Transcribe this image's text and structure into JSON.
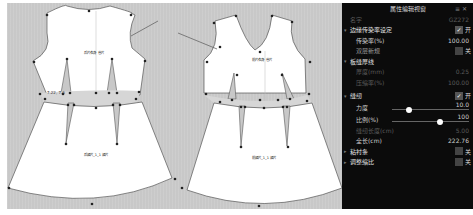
{
  "canvas": {
    "pieces": [
      {
        "name": "前片衣身",
        "label": "后片衣身 省片",
        "skirt_label": "后裙片_1_1 裙片"
      },
      {
        "name": "前片衣身V领",
        "label": "前片衣身 省片",
        "skirt_label": "前裙片_1_1 裙片"
      }
    ],
    "waist_measure": "7.22, 7.6",
    "colors": {
      "background": "#c8c8c8",
      "piece_fill": "#ffffff",
      "outline": "#555555",
      "waistband": "#d6d6d6"
    }
  },
  "panel": {
    "title": "属性编辑视窗",
    "header_icons": [
      "pin-icon",
      "close-icon"
    ],
    "rows": [
      {
        "type": "field",
        "label": "名字",
        "value": "GZ272",
        "dim": true
      },
      {
        "type": "section",
        "label": "边缘传染率设定",
        "toggle": true,
        "toggle_label": "开"
      },
      {
        "type": "field",
        "label": "传染率(%)",
        "value": "100.00",
        "sub": true
      },
      {
        "type": "checkbox",
        "label": "双层新规",
        "checked": false,
        "toggle_label": "关",
        "sub": true
      },
      {
        "type": "section",
        "label": "板缝厚线",
        "toggle": null
      },
      {
        "type": "field",
        "label": "厚度(mm)",
        "value": "0.25",
        "dim": true,
        "sub": true
      },
      {
        "type": "field",
        "label": "压缩率(%)",
        "value": "100.00",
        "dim": true,
        "sub": true
      },
      {
        "type": "section",
        "label": "缝纫",
        "toggle": true,
        "toggle_label": "开"
      },
      {
        "type": "slider",
        "label": "力度",
        "value": "10.0",
        "knob_pct": 22,
        "sub": true
      },
      {
        "type": "slider",
        "label": "比例(%)",
        "value": "100",
        "knob_pct": 62,
        "sub": true
      },
      {
        "type": "field",
        "label": "缝纫长度(cm)",
        "value": "5.00",
        "dim": true,
        "sub": true
      },
      {
        "type": "field",
        "label": "全长(cm)",
        "value": "222.76",
        "sub": true
      },
      {
        "type": "section",
        "label": "粘衬条",
        "toggle": false,
        "toggle_label": "关"
      },
      {
        "type": "section",
        "label": "调整缩比",
        "toggle": false,
        "toggle_label": "关"
      }
    ]
  }
}
